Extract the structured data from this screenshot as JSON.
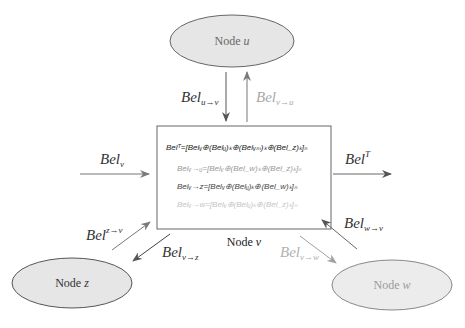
{
  "nodes": {
    "u": {
      "label_prefix": "Node ",
      "label_var": "u"
    },
    "v": {
      "label_prefix": "Node ",
      "label_var": "v"
    },
    "z": {
      "label_prefix": "Node ",
      "label_var": "z"
    },
    "w": {
      "label_prefix": "Node ",
      "label_var": "w"
    }
  },
  "messages": {
    "u_to_v": {
      "base": "Bel",
      "sub": "u→v"
    },
    "v_to_u": {
      "base": "Bel",
      "sub": "v→u"
    },
    "v_in": {
      "base": "Bel",
      "sub": "v"
    },
    "t_out": {
      "base": "Bel",
      "sup": "T"
    },
    "z_to_v": {
      "base": "Bel",
      "sup": "z→v"
    },
    "v_to_z": {
      "base": "Bel",
      "sub": "v→z"
    },
    "w_to_v": {
      "base": "Bel",
      "sub": "w→v"
    },
    "v_to_w": {
      "base": "Bel",
      "sub": "v→w"
    }
  },
  "formulas": [
    {
      "text": "Belᵀ=[Belᵥ⊕(Belᵤ)ₖ⊕(Belᵥₘ)ₖ⊕(Bel_z)ₖ]ₙ",
      "color": "#222222"
    },
    {
      "text": "Belᵥ→ᵤ=[Belᵥ⊕(Bel_w)ₖ⊕(Bel_z)ₖ]ₙ",
      "color": "#9a9a9a"
    },
    {
      "text": "Belᵥ→z=[Belᵥ⊕(Belᵤ)ₖ⊕(Bel_w)ₖ]ₙ",
      "color": "#444444"
    },
    {
      "text": "Belᵥ→w=[Belᵥ⊕(Belᵤ)ₖ⊕(Bel_z)ₖ]ₙ",
      "color": "#c4c4c4"
    }
  ],
  "colors": {
    "node_fill": "#e6e6e6",
    "node_stroke": "#555555",
    "arrow_dark": "#555555",
    "arrow_mid": "#888888",
    "arrow_light": "#aaaaaa",
    "text_dark": "#222222",
    "text_light": "#a8a8a8"
  }
}
